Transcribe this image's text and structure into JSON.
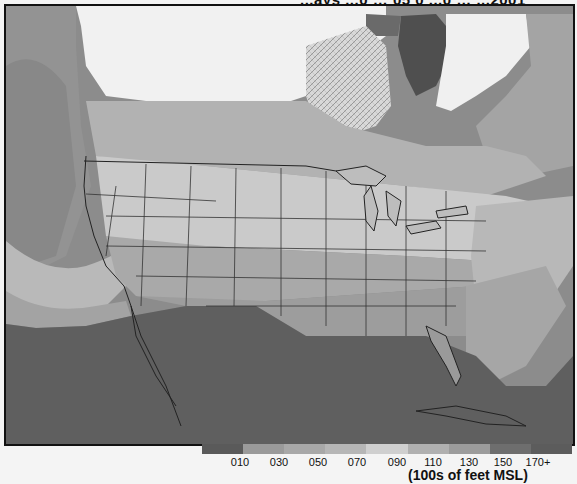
{
  "header": {
    "title_fragment": "...ays  ...0 … 05 0  ...0 … ...2001"
  },
  "map": {
    "description": "Freezing level chart over North America, grayscale shaded by altitude band",
    "region": "Continental United States, southern Canada, northern Mexico, Gulf of Mexico, Caribbean"
  },
  "legend": {
    "title": "(100s of feet MSL)",
    "bands": [
      {
        "label": "010",
        "color": "#5a5a5a"
      },
      {
        "label": "030",
        "color": "#9a9a9a"
      },
      {
        "label": "050",
        "color": "#a8a8a8"
      },
      {
        "label": "070",
        "color": "#b6b6b6"
      },
      {
        "label": "090",
        "color": "#cfcfcf"
      },
      {
        "label": "110",
        "color": "#b0b0b0"
      },
      {
        "label": "130",
        "color": "#9c9c9c"
      },
      {
        "label": "150",
        "color": "#6e6e6e"
      },
      {
        "label": "170+",
        "color": "#5c5c5c"
      }
    ],
    "labels": [
      "010",
      "030",
      "050",
      "070",
      "090",
      "110",
      "130",
      "150",
      "170+"
    ]
  },
  "footer": {
    "ghost_text": "...ational Weather Center (AWC) provides freezing level graphics on its Web..."
  }
}
